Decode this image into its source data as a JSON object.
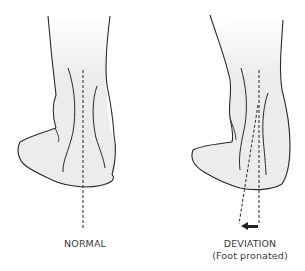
{
  "figure": {
    "panels": [
      {
        "id": "normal",
        "caption": "NORMAL",
        "subcaption": ""
      },
      {
        "id": "deviation",
        "caption": "DEVIATION",
        "subcaption": "(Foot pronated)"
      }
    ],
    "colors": {
      "outline": "#2a2a2a",
      "skin_fill": "#ececec",
      "background": "#ffffff",
      "axis_line": "#3a3a3a",
      "arrow": "#222222"
    }
  }
}
